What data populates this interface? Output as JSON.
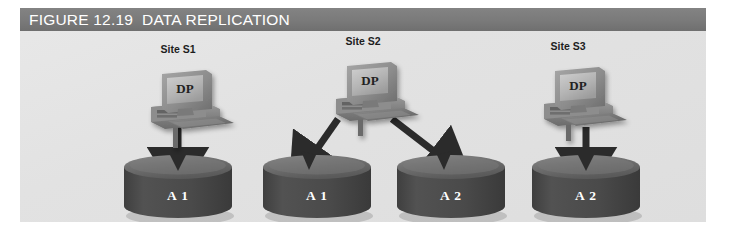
{
  "figure": {
    "header": {
      "label": "FIGURE 12.19",
      "title": "DATA REPLICATION"
    },
    "background_color": "#e3e3e3",
    "header_color": "#7d7d7d"
  },
  "sites": [
    {
      "id": "site-s1",
      "label": "Site S1",
      "screen_text": "DP",
      "center_x": 158,
      "label_y": 12
    },
    {
      "id": "site-s2",
      "label": "Site S2",
      "screen_text": "DP",
      "center_x": 343,
      "label_y": 12
    },
    {
      "id": "site-s3",
      "label": "Site S3",
      "screen_text": "DP",
      "center_x": 548,
      "label_y": 12
    }
  ],
  "databases": [
    {
      "id": "db-1",
      "label": "A 1",
      "center_x": 158,
      "top": 128
    },
    {
      "id": "db-2",
      "label": "A 1",
      "center_x": 297,
      "top": 128
    },
    {
      "id": "db-3",
      "label": "A 2",
      "center_x": 431,
      "top": 128
    },
    {
      "id": "db-4",
      "label": "A 2",
      "center_x": 566,
      "top": 128
    }
  ],
  "arrows": [
    {
      "id": "arrow-s1-a1",
      "from": "site-s1",
      "to": "db-1",
      "kind": "vertical"
    },
    {
      "id": "arrow-s2-a1",
      "from": "site-s2",
      "to": "db-2",
      "kind": "diagonal-left"
    },
    {
      "id": "arrow-s2-a2",
      "from": "site-s2",
      "to": "db-3",
      "kind": "diagonal-right"
    },
    {
      "id": "arrow-s3-a2",
      "from": "site-s3",
      "to": "db-4",
      "kind": "vertical"
    }
  ],
  "colors": {
    "cylinder_body": "#4c4c4c",
    "cylinder_top": "#6e6e6e",
    "arrow": "#2e2e2e",
    "monitor_case": "#8a8a8a",
    "screen": "#b9b9b9",
    "text_dark": "#1d1d1d",
    "text_light": "#ffffff"
  }
}
